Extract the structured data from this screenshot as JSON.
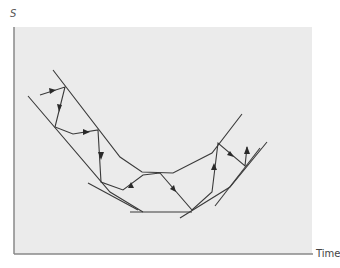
{
  "labels": {
    "y_axis": "S",
    "x_axis": "Time"
  },
  "colors": {
    "background": "#ebebeb",
    "line": "#3a3a3a",
    "axis": "#888888"
  },
  "diagram": {
    "upper_boundary": [
      [
        53,
        70
      ],
      [
        120,
        157
      ],
      [
        142,
        172
      ],
      [
        173,
        173
      ],
      [
        212,
        153
      ],
      [
        242,
        114
      ]
    ],
    "lower_boundary": [
      [
        28,
        96
      ],
      [
        110,
        192
      ],
      [
        143,
        212
      ]
    ],
    "bottom_segment": [
      [
        130,
        212
      ],
      [
        192,
        212
      ]
    ],
    "lower_right_boundary": [
      [
        180,
        218
      ],
      [
        230,
        187
      ],
      [
        267,
        142
      ]
    ],
    "second_right_line": [
      [
        215,
        206
      ],
      [
        260,
        148
      ]
    ],
    "left_short_line": [
      [
        88,
        183
      ],
      [
        138,
        210
      ]
    ],
    "path": [
      [
        40,
        95
      ],
      [
        65,
        87
      ],
      [
        55,
        127
      ],
      [
        73,
        134
      ],
      [
        98,
        130
      ],
      [
        101,
        182
      ],
      [
        123,
        190
      ],
      [
        143,
        175
      ],
      [
        160,
        173
      ],
      [
        192,
        210
      ],
      [
        212,
        192
      ],
      [
        218,
        143
      ],
      [
        245,
        166
      ],
      [
        247,
        147
      ]
    ],
    "arrows": [
      {
        "at": [
          53,
          91
        ],
        "dir": "right"
      },
      {
        "at": [
          60,
          108
        ],
        "dir": "down"
      },
      {
        "at": [
          86,
          132
        ],
        "dir": "right"
      },
      {
        "at": [
          100,
          156
        ],
        "dir": "down"
      },
      {
        "at": [
          132,
          183
        ],
        "dir": "up-right"
      },
      {
        "at": [
          174,
          190
        ],
        "dir": "down-right"
      },
      {
        "at": [
          215,
          168
        ],
        "dir": "up"
      },
      {
        "at": [
          231,
          154
        ],
        "dir": "down-right"
      },
      {
        "at": [
          247,
          152
        ],
        "dir": "up"
      }
    ]
  }
}
